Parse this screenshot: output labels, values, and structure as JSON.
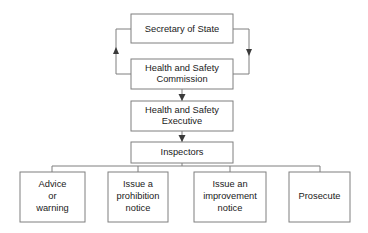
{
  "diagram": {
    "colors": {
      "background": "#ffffff",
      "box_border": "#7f7f7f",
      "connector": "#7f7f7f",
      "arrow_head": "#3a3a3a",
      "text": "#1a1a1a"
    },
    "nodes": {
      "secretary_of_state": {
        "label": "Secretary of State",
        "lines": [
          "Secretary of State"
        ]
      },
      "hs_commission": {
        "label": "Health and Safety Commission",
        "lines": [
          "Health and Safety",
          "Commission"
        ]
      },
      "hs_executive": {
        "label": "Health and Safety Executive",
        "lines": [
          "Health and Safety",
          "Executive"
        ]
      },
      "inspectors": {
        "label": "Inspectors",
        "lines": [
          "Inspectors"
        ]
      }
    },
    "actions": [
      {
        "id": "advice-or-warning",
        "label": "Advice or warning",
        "lines": [
          "Advice",
          "or",
          "warning"
        ]
      },
      {
        "id": "prohibition-notice",
        "label": "Issue a prohibition notice",
        "lines": [
          "Issue a",
          "prohibition",
          "notice"
        ]
      },
      {
        "id": "improvement-notice",
        "label": "Issue an improvement notice",
        "lines": [
          "Issue an",
          "improvement",
          "notice"
        ]
      },
      {
        "id": "prosecute",
        "label": "Prosecute",
        "lines": [
          "Prosecute"
        ]
      }
    ],
    "edges": [
      {
        "id": "secretary-to-commission",
        "from": "Secretary of State",
        "to": "Health and Safety Commission",
        "direction": "down",
        "route": "right-side"
      },
      {
        "id": "commission-to-secretary",
        "from": "Health and Safety Commission",
        "to": "Secretary of State",
        "direction": "up",
        "route": "left-side"
      },
      {
        "id": "commission-to-executive",
        "from": "Health and Safety Commission",
        "to": "Health and Safety Executive",
        "direction": "down",
        "route": "center"
      },
      {
        "id": "executive-to-inspectors",
        "from": "Health and Safety Executive",
        "to": "Inspectors",
        "direction": "down",
        "route": "center"
      },
      {
        "id": "inspectors-to-actions",
        "from": "Inspectors",
        "to": "actions",
        "direction": "down",
        "route": "fan-out"
      }
    ]
  }
}
